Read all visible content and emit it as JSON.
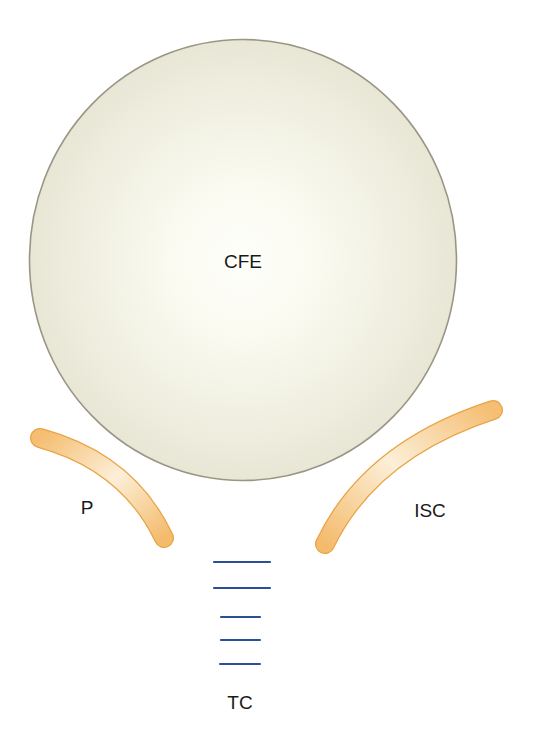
{
  "diagram": {
    "labels": {
      "cfe": "CFE",
      "p": "P",
      "isc": "ISC",
      "tc": "TC"
    },
    "colors": {
      "circle_fill_center": "#FFFFFA",
      "circle_fill_edge": "#E8E7D6",
      "circle_stroke": "#9A9585",
      "band_fill": "#F5C27A",
      "band_highlight": "#FCEFD8",
      "band_stroke": "#E9A346",
      "line_color": "#2B4F96",
      "text_color": "#1a1a1a"
    },
    "elements": [
      {
        "id": "cfe",
        "shape": "circle",
        "label": "CFE"
      },
      {
        "id": "p",
        "shape": "curved-band",
        "label": "P"
      },
      {
        "id": "isc",
        "shape": "curved-band",
        "label": "ISC"
      },
      {
        "id": "tc",
        "shape": "stacked-lines",
        "line_count": 5,
        "label": "TC"
      }
    ]
  }
}
